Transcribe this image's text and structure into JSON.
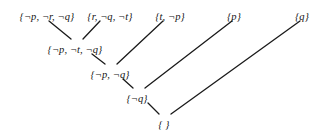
{
  "figure": {
    "type": "resolution-refutation-dag",
    "background_color": "#ffffff",
    "edge_color": "#1a1a1a",
    "text_color": "#131313",
    "nodes": [
      {
        "id": "n1",
        "label": "{¬p, ¬r, ¬q}",
        "level": 0,
        "x": 47,
        "y": 12
      },
      {
        "id": "n2",
        "label": "{r, ¬q, ¬t}",
        "level": 0,
        "x": 110,
        "y": 12
      },
      {
        "id": "n3",
        "label": "{t, ¬p}",
        "level": 0,
        "x": 170,
        "y": 12
      },
      {
        "id": "n4",
        "label": "{p}",
        "level": 0,
        "x": 234,
        "y": 12
      },
      {
        "id": "n5",
        "label": "{q}",
        "level": 0,
        "x": 302,
        "y": 12
      },
      {
        "id": "n6",
        "label": "{¬p, ¬t, ¬q}",
        "level": 1,
        "x": 75,
        "y": 45
      },
      {
        "id": "n7",
        "label": "{¬p, ¬q}",
        "level": 2,
        "x": 110,
        "y": 70
      },
      {
        "id": "n8",
        "label": "{¬q}",
        "level": 3,
        "x": 137,
        "y": 94
      },
      {
        "id": "n9",
        "label": "{ }",
        "level": 4,
        "x": 164,
        "y": 120
      }
    ],
    "edges": [
      {
        "from": "n1",
        "to": "n6",
        "x1": 49,
        "y1": 21,
        "x2": 71,
        "y2": 39
      },
      {
        "from": "n2",
        "to": "n6",
        "x1": 100,
        "y1": 21,
        "x2": 83,
        "y2": 39
      },
      {
        "from": "n6",
        "to": "n7",
        "x1": 92,
        "y1": 54,
        "x2": 105,
        "y2": 64
      },
      {
        "from": "n3",
        "to": "n7",
        "x1": 163,
        "y1": 21,
        "x2": 117,
        "y2": 64
      },
      {
        "from": "n7",
        "to": "n8",
        "x1": 123,
        "y1": 79,
        "x2": 133,
        "y2": 88
      },
      {
        "from": "n4",
        "to": "n8",
        "x1": 232,
        "y1": 21,
        "x2": 145,
        "y2": 88
      },
      {
        "from": "n8",
        "to": "n9",
        "x1": 148,
        "y1": 103,
        "x2": 159,
        "y2": 114
      },
      {
        "from": "n5",
        "to": "n9",
        "x1": 300,
        "y1": 21,
        "x2": 171,
        "y2": 114
      }
    ]
  }
}
